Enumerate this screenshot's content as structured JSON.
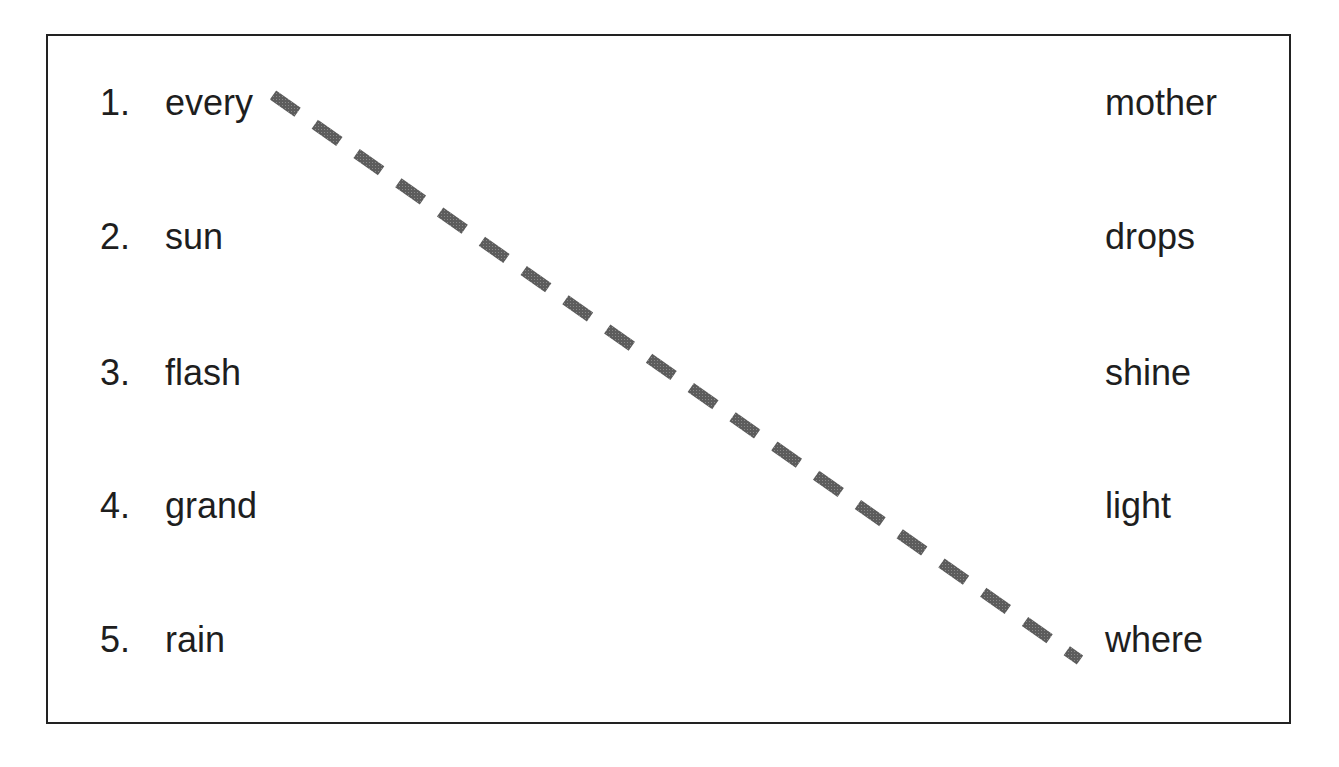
{
  "worksheet": {
    "left_items": [
      {
        "number": "1.",
        "word": "every"
      },
      {
        "number": "2.",
        "word": "sun"
      },
      {
        "number": "3.",
        "word": "flash"
      },
      {
        "number": "4.",
        "word": "grand"
      },
      {
        "number": "5.",
        "word": "rain"
      }
    ],
    "right_items": [
      "mother",
      "drops",
      "shine",
      "light",
      "where"
    ],
    "connector": {
      "from": "every",
      "to": "where",
      "style": "dashed",
      "color": "#5a5a5a"
    }
  }
}
